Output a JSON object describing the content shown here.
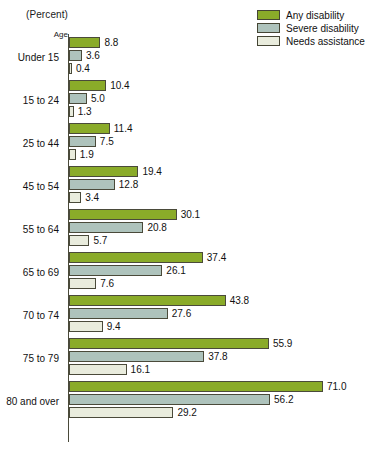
{
  "axis_note": "(Percent)",
  "category_axis_title": "Age",
  "legend": {
    "items": [
      {
        "label": "Any disability",
        "color": "#8aab29"
      },
      {
        "label": "Severe disability",
        "color": "#aec3bc"
      },
      {
        "label": "Needs assistance",
        "color": "#e9ecdd"
      }
    ]
  },
  "chart_data": {
    "type": "bar",
    "orientation": "horizontal",
    "title": "",
    "subtitle": "",
    "xlabel": "(Percent)",
    "ylabel": "Age",
    "xlim": [
      0,
      71
    ],
    "grid": false,
    "legend_position": "top-right",
    "categories": [
      "Under 15",
      "15 to 24",
      "25 to 44",
      "45 to 54",
      "55 to 64",
      "65 to 69",
      "70 to 74",
      "75 to 79",
      "80 and over"
    ],
    "series": [
      {
        "name": "Any disability",
        "color": "#8aab29",
        "values": [
          8.8,
          10.4,
          11.4,
          19.4,
          30.1,
          37.4,
          43.8,
          55.9,
          71.0
        ]
      },
      {
        "name": "Severe disability",
        "color": "#aec3bc",
        "values": [
          3.6,
          5.0,
          7.5,
          12.8,
          20.8,
          26.1,
          27.6,
          37.8,
          56.2
        ]
      },
      {
        "name": "Needs assistance",
        "color": "#e9ecdd",
        "values": [
          0.4,
          1.3,
          1.9,
          3.4,
          5.7,
          7.6,
          9.4,
          16.1,
          29.2
        ]
      }
    ],
    "value_labels": [
      [
        "8.8",
        "3.6",
        "0.4"
      ],
      [
        "10.4",
        "5.0",
        "1.3"
      ],
      [
        "11.4",
        "7.5",
        "1.9"
      ],
      [
        "19.4",
        "12.8",
        "3.4"
      ],
      [
        "30.1",
        "20.8",
        "5.7"
      ],
      [
        "37.4",
        "26.1",
        "7.6"
      ],
      [
        "43.8",
        "27.6",
        "9.4"
      ],
      [
        "55.9",
        "37.8",
        "16.1"
      ],
      [
        "71.0",
        "56.2",
        "29.2"
      ]
    ]
  }
}
